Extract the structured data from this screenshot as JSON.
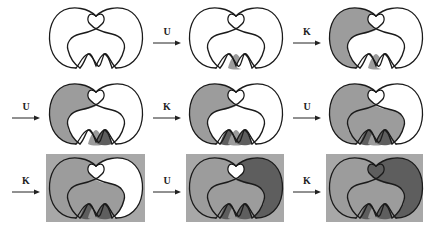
{
  "figure": {
    "colors": {
      "stroke": "#1a1a1a",
      "white": "#ffffff",
      "light_gray": "#9c9c9c",
      "dark_gray": "#5e5e5e",
      "box_bg": "#a8a8a8"
    },
    "arrows": [
      {
        "label": "U"
      },
      {
        "label": "K"
      },
      {
        "label": "U"
      },
      {
        "label": "K"
      },
      {
        "label": "U"
      },
      {
        "label": "K"
      },
      {
        "label": "U"
      },
      {
        "label": "K"
      }
    ],
    "panels": [
      {
        "step": 0,
        "left_lobe": "white",
        "right_lobe": "white",
        "inner": "white",
        "loop": "white",
        "bg": "none",
        "bumps": [
          "white",
          "white",
          "white"
        ]
      },
      {
        "step": 1,
        "left_lobe": "white",
        "right_lobe": "white",
        "inner": "white",
        "loop": "white",
        "bg": "none",
        "bumps": [
          "white",
          "light_gray",
          "white"
        ]
      },
      {
        "step": 2,
        "left_lobe": "light_gray",
        "right_lobe": "white",
        "inner": "white",
        "loop": "white",
        "bg": "none",
        "bumps": [
          "white",
          "light_gray",
          "white"
        ]
      },
      {
        "step": 3,
        "left_lobe": "light_gray",
        "right_lobe": "white",
        "inner": "white",
        "loop": "white",
        "bg": "none",
        "bumps": [
          "white",
          "light_gray",
          "dark_gray"
        ]
      },
      {
        "step": 4,
        "left_lobe": "light_gray",
        "right_lobe": "white",
        "inner": "white",
        "loop": "white",
        "bg": "none",
        "bumps": [
          "dark_gray",
          "light_gray",
          "dark_gray"
        ]
      },
      {
        "step": 5,
        "left_lobe": "light_gray",
        "right_lobe": "white",
        "inner": "light_gray",
        "loop": "white",
        "bg": "none",
        "bumps": [
          "dark_gray",
          "light_gray",
          "dark_gray"
        ]
      },
      {
        "step": 6,
        "left_lobe": "light_gray",
        "right_lobe": "white",
        "inner": "light_gray",
        "loop": "white",
        "bg": "box_bg",
        "bumps": [
          "dark_gray",
          "light_gray",
          "dark_gray"
        ]
      },
      {
        "step": 7,
        "left_lobe": "light_gray",
        "right_lobe": "dark_gray",
        "inner": "light_gray",
        "loop": "white",
        "bg": "box_bg",
        "bumps": [
          "dark_gray",
          "light_gray",
          "dark_gray"
        ]
      },
      {
        "step": 8,
        "left_lobe": "light_gray",
        "right_lobe": "dark_gray",
        "inner": "light_gray",
        "loop": "dark_gray",
        "bg": "box_bg",
        "bumps": [
          "dark_gray",
          "light_gray",
          "dark_gray"
        ]
      }
    ]
  }
}
